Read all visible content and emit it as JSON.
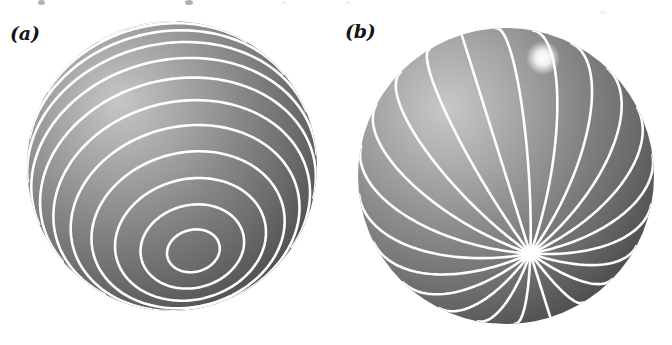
{
  "figure": {
    "kind": "two-sphere-diagram",
    "background_color": "#ffffff",
    "line_color": "#ffffff",
    "sphere_dark": "#5a5a5a",
    "sphere_mid": "#7d7d7d",
    "sphere_light": "#bdbdbd",
    "label_color": "#151515"
  },
  "panels": [
    {
      "label": "(a)",
      "name": "sphere-parallels",
      "description": "Shaded sphere overlaid with latitude circles (parallels)",
      "center": {
        "x": 172,
        "y": 166
      },
      "radius": 145,
      "pole": {
        "x": 200,
        "y": 55
      },
      "line_family": "parallels",
      "line_count": 17,
      "line_width": 2.6
    },
    {
      "label": "(b)",
      "name": "sphere-meridians",
      "description": "Shaded sphere overlaid with longitude lines (meridians) converging at a pole",
      "center": {
        "x": 506,
        "y": 176
      },
      "radius": 148,
      "pole": {
        "x": 543,
        "y": 58
      },
      "line_family": "meridians",
      "line_count": 22,
      "line_width": 2.6
    }
  ],
  "lighting": {
    "highlight_offset_x": -0.36,
    "highlight_offset_y": -0.4,
    "highlight_color": "#c6c6c6",
    "shadow_color": "#4e4e4e"
  },
  "artifacts": {
    "note": "faint cropped descender marks along the very top edge of the scan",
    "marks": [
      {
        "x": 38,
        "y": 0,
        "w": 7,
        "h": 5,
        "faint": false
      },
      {
        "x": 185,
        "y": 0,
        "w": 8,
        "h": 5,
        "faint": false
      },
      {
        "x": 281,
        "y": 1,
        "w": 5,
        "h": 3,
        "faint": true
      },
      {
        "x": 345,
        "y": 1,
        "w": 5,
        "h": 3,
        "faint": true
      },
      {
        "x": 600,
        "y": 11,
        "w": 5,
        "h": 3,
        "faint": true
      }
    ]
  }
}
